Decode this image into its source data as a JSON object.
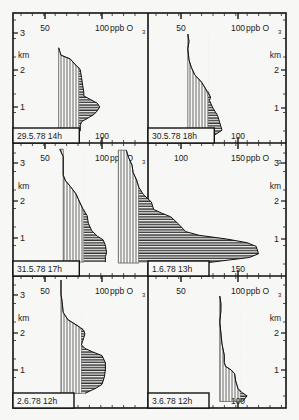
{
  "figure": {
    "units_label": "ppb",
    "species_label": "O",
    "species_sub": "3",
    "y_unit": "km"
  },
  "chart_data": [
    {
      "type": "area",
      "title": "29.5.78 14h",
      "xlabel": "ppb O3",
      "ylabel": "km",
      "x_ticks_top": [
        "50",
        "100"
      ],
      "x_ticks_bottom": [
        "100"
      ],
      "y_ticks": [
        "1",
        "2",
        "3"
      ],
      "ylim": [
        0.3,
        3.5
      ],
      "background_ppb": 62,
      "profile": [
        [
          0.35,
          81
        ],
        [
          0.5,
          81
        ],
        [
          0.6,
          82
        ],
        [
          0.8,
          93
        ],
        [
          0.9,
          96
        ],
        [
          1.0,
          98
        ],
        [
          1.1,
          96
        ],
        [
          1.2,
          90
        ],
        [
          1.3,
          84
        ],
        [
          1.4,
          84
        ],
        [
          1.6,
          83
        ],
        [
          1.8,
          82
        ],
        [
          2.0,
          81
        ],
        [
          2.05,
          80
        ],
        [
          2.1,
          78
        ],
        [
          2.3,
          72
        ],
        [
          2.4,
          64
        ],
        [
          2.5,
          63
        ],
        [
          2.6,
          62
        ]
      ]
    },
    {
      "type": "area",
      "title": "30.5.78 18h",
      "xlabel": "ppb O3",
      "ylabel": "km",
      "x_ticks_top": [
        "50",
        "100"
      ],
      "x_ticks_bottom": [
        "100"
      ],
      "y_ticks": [
        "1",
        "2"
      ],
      "ylim": [
        0.1,
        3.2
      ],
      "background_ppb": 56,
      "profile": [
        [
          0.15,
          72
        ],
        [
          0.3,
          81
        ],
        [
          0.4,
          86
        ],
        [
          0.6,
          84
        ],
        [
          0.8,
          82
        ],
        [
          1.0,
          78
        ],
        [
          1.2,
          75
        ],
        [
          1.3,
          76
        ],
        [
          1.5,
          72
        ],
        [
          1.7,
          68
        ],
        [
          1.9,
          62
        ],
        [
          2.1,
          59
        ],
        [
          2.3,
          57
        ],
        [
          2.6,
          56
        ],
        [
          2.8,
          57
        ],
        [
          3.0,
          56
        ]
      ]
    },
    {
      "type": "area",
      "title": "31.5.78 17h",
      "xlabel": "ppb O3",
      "ylabel": "km",
      "x_ticks_top": [
        "50",
        "100"
      ],
      "x_ticks_bottom": [],
      "y_ticks": [
        "1",
        "2",
        "3"
      ],
      "ylim": [
        0.3,
        3.5
      ],
      "background_ppb": 66,
      "profile": [
        [
          0.35,
          103
        ],
        [
          0.5,
          103
        ],
        [
          0.6,
          104
        ],
        [
          0.8,
          103
        ],
        [
          0.95,
          101
        ],
        [
          1.05,
          96
        ],
        [
          1.2,
          91
        ],
        [
          1.4,
          88
        ],
        [
          1.6,
          87
        ],
        [
          1.8,
          83
        ],
        [
          2.0,
          80
        ],
        [
          2.2,
          77
        ],
        [
          2.4,
          72
        ],
        [
          2.55,
          68
        ],
        [
          2.7,
          66
        ],
        [
          3.0,
          66
        ],
        [
          3.2,
          66
        ],
        [
          3.4,
          63
        ]
      ]
    },
    {
      "type": "area",
      "title": "1.6.78 13h",
      "xlabel": "ppb O3",
      "ylabel": "km",
      "x_ticks_top": [
        "100",
        "150"
      ],
      "x_ticks_bottom": [
        "150"
      ],
      "y_ticks": [
        "1",
        "2",
        "3"
      ],
      "ylim": [
        0.3,
        3.5
      ],
      "background_ppb": 45,
      "profile": [
        [
          0.35,
          120
        ],
        [
          0.5,
          160
        ],
        [
          0.6,
          168
        ],
        [
          0.8,
          166
        ],
        [
          0.9,
          158
        ],
        [
          1.0,
          140
        ],
        [
          1.1,
          116
        ],
        [
          1.2,
          104
        ],
        [
          1.4,
          98
        ],
        [
          1.6,
          91
        ],
        [
          1.7,
          83
        ],
        [
          1.8,
          76
        ],
        [
          2.0,
          74
        ],
        [
          2.2,
          67
        ],
        [
          2.4,
          63
        ],
        [
          2.6,
          61
        ],
        [
          2.8,
          58
        ],
        [
          3.0,
          57
        ],
        [
          3.2,
          54
        ],
        [
          3.4,
          52
        ]
      ]
    },
    {
      "type": "area",
      "title": "2.6.78 12h",
      "xlabel": "ppb O3",
      "ylabel": "km",
      "x_ticks_top": [
        "50",
        "100"
      ],
      "x_ticks_bottom": [],
      "y_ticks": [
        "1",
        "2",
        "3"
      ],
      "ylim": [
        0.3,
        3.5
      ],
      "background_ppb": 64,
      "profile": [
        [
          0.35,
          85
        ],
        [
          0.5,
          95
        ],
        [
          0.6,
          100
        ],
        [
          0.8,
          102
        ],
        [
          1.0,
          103
        ],
        [
          1.2,
          103
        ],
        [
          1.4,
          100
        ],
        [
          1.5,
          92
        ],
        [
          1.6,
          85
        ],
        [
          1.7,
          82
        ],
        [
          1.8,
          83
        ],
        [
          1.9,
          84
        ],
        [
          2.0,
          85
        ],
        [
          2.1,
          84
        ],
        [
          2.2,
          80
        ],
        [
          2.4,
          70
        ],
        [
          2.6,
          66
        ],
        [
          2.9,
          65
        ],
        [
          3.1,
          64
        ],
        [
          3.3,
          64
        ],
        [
          3.5,
          64
        ]
      ]
    },
    {
      "type": "area",
      "title": "3.6.78 12h",
      "xlabel": "ppb O3",
      "ylabel": "km",
      "x_ticks_top": [
        "50",
        "100"
      ],
      "x_ticks_bottom": [
        "100"
      ],
      "y_ticks": [
        "1",
        "2"
      ],
      "ylim": [
        0.1,
        3.1
      ],
      "background_ppb": 84,
      "profile": [
        [
          0.15,
          104
        ],
        [
          0.3,
          108
        ],
        [
          0.4,
          103
        ],
        [
          0.5,
          100
        ],
        [
          0.7,
          98
        ],
        [
          0.9,
          97
        ],
        [
          1.0,
          94
        ],
        [
          1.1,
          89
        ],
        [
          1.2,
          88
        ],
        [
          1.4,
          88
        ],
        [
          1.7,
          86
        ],
        [
          2.0,
          85
        ],
        [
          2.3,
          84
        ],
        [
          2.6,
          85
        ],
        [
          2.8,
          85
        ],
        [
          3.0,
          84
        ]
      ]
    }
  ]
}
